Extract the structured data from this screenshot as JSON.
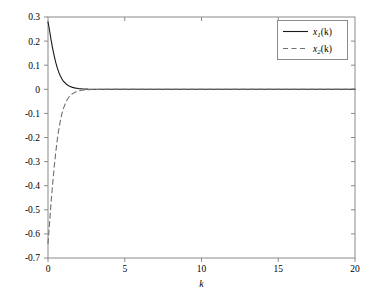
{
  "chart_data": {
    "type": "line",
    "title": "",
    "subtitle": "",
    "xlabel": "k",
    "ylabel": "",
    "xlim": [
      0,
      20
    ],
    "ylim": [
      -0.7,
      0.3
    ],
    "grid": false,
    "legend_position": "top-right",
    "xticks": [
      0,
      5,
      10,
      15,
      20
    ],
    "xtick_labels": [
      "0",
      "5",
      "10",
      "15",
      "20"
    ],
    "yticks": [
      0.3,
      0.2,
      0.1,
      0,
      -0.1,
      -0.2,
      -0.3,
      -0.4,
      -0.5,
      -0.6,
      -0.7
    ],
    "ytick_labels": [
      "0.3",
      "0.2",
      "0.1",
      "0",
      "-0.1",
      "-0.2",
      "-0.3",
      "-0.4",
      "-0.5",
      "-0.6",
      "-0.7"
    ],
    "series": [
      {
        "name": "x_1(k)",
        "legend_label": "x1(k)",
        "legend_base": "x",
        "legend_index": "1",
        "legend_arg": "(k)",
        "style": "solid",
        "color": "#1a1a1a",
        "x": [
          0,
          0.1,
          0.2,
          0.3,
          0.4,
          0.5,
          0.6,
          0.7,
          0.8,
          0.9,
          1.0,
          1.2,
          1.4,
          1.6,
          1.8,
          2.0,
          2.3,
          2.6,
          3.0,
          3.5,
          4.0,
          5.0,
          6.0,
          7.0,
          8.0,
          9.0,
          10.0,
          12.0,
          14.0,
          16.0,
          18.0,
          20.0
        ],
        "y": [
          0.28,
          0.245,
          0.205,
          0.17,
          0.14,
          0.113,
          0.09,
          0.071,
          0.056,
          0.044,
          0.034,
          0.021,
          0.013,
          0.008,
          0.005,
          0.003,
          0.0015,
          0.0008,
          0.0004,
          0.0002,
          0.0001,
          0,
          0,
          0,
          0,
          0,
          0,
          0,
          0,
          0,
          0,
          0
        ]
      },
      {
        "name": "x_2(k)",
        "legend_label": "x2(k)",
        "legend_base": "x",
        "legend_index": "2",
        "legend_arg": "(k)",
        "style": "dashed",
        "color": "#707070",
        "x": [
          0,
          0.1,
          0.2,
          0.3,
          0.4,
          0.5,
          0.6,
          0.7,
          0.8,
          0.9,
          1.0,
          1.2,
          1.4,
          1.6,
          1.8,
          2.0,
          2.3,
          2.6,
          3.0,
          3.5,
          4.0,
          5.0,
          6.0,
          7.0,
          8.0,
          9.0,
          10.0,
          12.0,
          14.0,
          16.0,
          18.0,
          20.0
        ],
        "y": [
          -0.64,
          -0.555,
          -0.47,
          -0.395,
          -0.325,
          -0.265,
          -0.212,
          -0.168,
          -0.132,
          -0.103,
          -0.08,
          -0.048,
          -0.029,
          -0.018,
          -0.011,
          -0.0065,
          -0.003,
          -0.0015,
          -0.0007,
          -0.0003,
          -0.0001,
          0,
          0,
          0,
          0,
          0,
          0,
          0,
          0,
          0,
          0,
          0
        ]
      }
    ],
    "annotations": [],
    "axes_color": "#8a8a8a",
    "background": "#ffffff"
  }
}
